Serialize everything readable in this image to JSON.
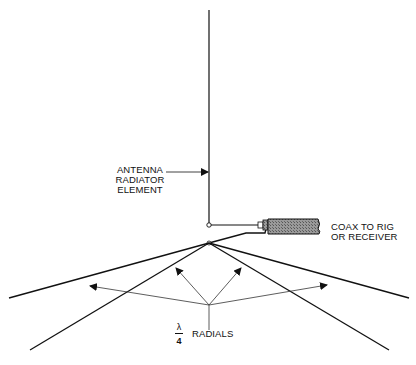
{
  "diagram": {
    "type": "quarter-wave ground-plane antenna",
    "labels": {
      "radiator": [
        "ANTENNA",
        "RADIATOR",
        "ELEMENT"
      ],
      "coax": [
        "COAX TO RIG",
        "OR RECEIVER"
      ],
      "radials_fraction_num": "λ",
      "radials_fraction_den": "4",
      "radials": "RADIALS"
    },
    "colors": {
      "line": "#111111",
      "coax_fill": "#8a8a8a",
      "background": "#ffffff"
    }
  }
}
